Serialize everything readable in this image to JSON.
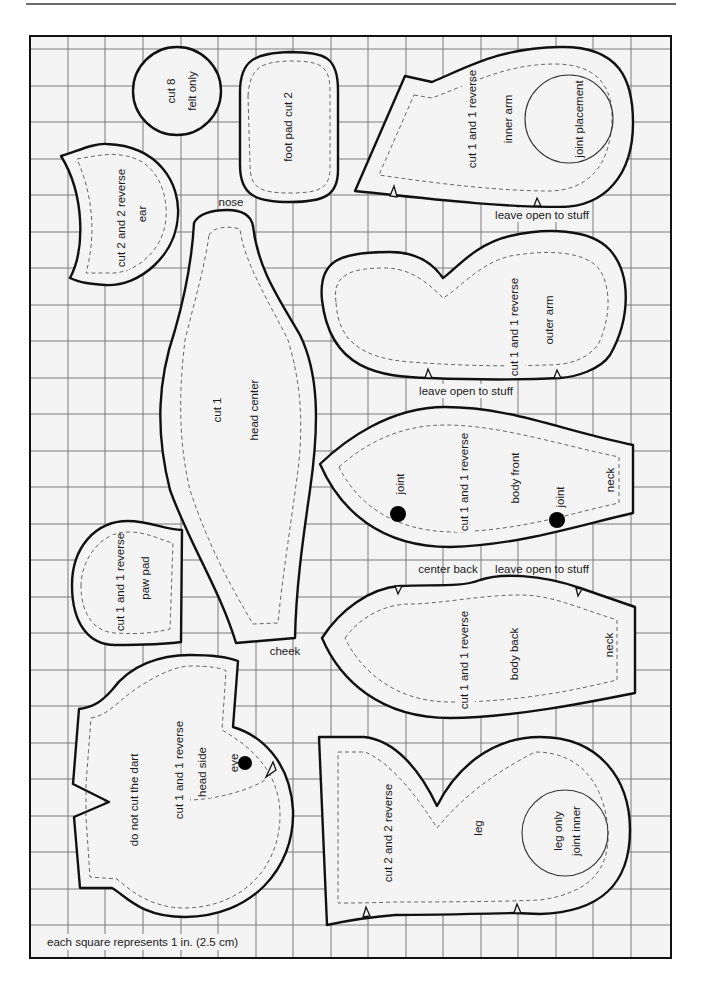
{
  "sheet": {
    "scale_note": "each square represents 1 in. (2.5 cm)",
    "grid": {
      "columns": 17,
      "rows": 25,
      "square_size": "1 in. (2.5 cm)"
    },
    "colors": {
      "paper": "#f4f4f4",
      "outline": "#111111",
      "seam": "#666666",
      "grid": "#7a7a7a"
    }
  },
  "pieces": {
    "eye_circle": {
      "lines": [
        "cut 8",
        "felt only"
      ]
    },
    "foot_pad": {
      "lines": [
        "foot pad cut 2"
      ]
    },
    "inner_arm": {
      "lines": [
        "cut 1 and 1 reverse",
        "inner arm",
        "joint placement"
      ],
      "note": "leave open to stuff"
    },
    "ear": {
      "lines": [
        "cut 2 and 2 reverse",
        "ear"
      ]
    },
    "head_center": {
      "lines": [
        "cut 1",
        "head center"
      ],
      "top_note": "nose",
      "bottom_note": "cheek"
    },
    "outer_arm": {
      "lines": [
        "cut 1 and 1 reverse",
        "outer arm"
      ],
      "note": "leave open to stuff"
    },
    "body_front": {
      "lines": [
        "cut 1 and 1 reverse",
        "body front",
        "neck"
      ],
      "joint_labels": [
        "joint",
        "joint"
      ]
    },
    "paw_pad": {
      "lines": [
        "cut 1 and 1 reverse",
        "paw pad"
      ]
    },
    "body_back": {
      "lines": [
        "cut 1 and 1 reverse",
        "body back",
        "neck"
      ],
      "notes": [
        "center back",
        "leave open to stuff"
      ]
    },
    "head_side": {
      "lines": [
        "do not cut the dart",
        "cut 1 and 1 reverse",
        "head side",
        "eye"
      ]
    },
    "leg": {
      "lines": [
        "cut 2 and 2 reverse",
        "leg",
        "leg only",
        "joint inner"
      ]
    }
  }
}
